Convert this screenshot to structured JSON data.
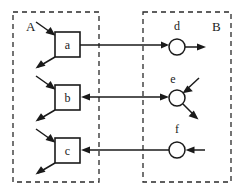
{
  "diagram": {
    "background_color": "#ffffff",
    "stroke_color": "#1a1a1a",
    "dash_color": "#2a2a2a",
    "regions": [
      {
        "id": "A",
        "label": "A",
        "label_x": 26,
        "label_y": 31,
        "x": 13,
        "y": 12,
        "width": 86,
        "height": 170
      },
      {
        "id": "B",
        "label": "B",
        "label_x": 212,
        "label_y": 31,
        "x": 143,
        "y": 12,
        "width": 88,
        "height": 170
      }
    ],
    "boxes": [
      {
        "id": "a",
        "label": "a",
        "x": 55,
        "y": 32,
        "width": 25,
        "height": 25,
        "cx": 67.5,
        "cy": 44.5,
        "label_y": 49
      },
      {
        "id": "b",
        "label": "b",
        "x": 55,
        "y": 85,
        "width": 25,
        "height": 25,
        "cx": 67.5,
        "cy": 97.5,
        "label_y": 102
      },
      {
        "id": "c",
        "label": "c",
        "x": 55,
        "y": 138,
        "width": 25,
        "height": 25,
        "cx": 67.5,
        "cy": 150.5,
        "label_y": 155
      }
    ],
    "circles": [
      {
        "id": "d",
        "label": "d",
        "cx": 177,
        "cy": 47,
        "r": 8,
        "label_x": 177,
        "label_y": 30
      },
      {
        "id": "e",
        "label": "e",
        "cx": 177,
        "cy": 98,
        "r": 8,
        "label_x": 173,
        "label_y": 83
      },
      {
        "id": "f",
        "label": "f",
        "cx": 177,
        "cy": 150,
        "r": 8,
        "label_x": 177,
        "label_y": 133
      }
    ],
    "connections": [
      {
        "id": "a-to-d",
        "from": "a",
        "to": "d",
        "direction": "forward",
        "row": 1
      },
      {
        "id": "b-to-e",
        "from": "b",
        "to": "e",
        "direction": "bidirectional",
        "row": 2
      },
      {
        "id": "f-to-c",
        "from": "f",
        "to": "c",
        "direction": "backward",
        "row": 3
      }
    ],
    "external_arrows": [
      {
        "id": "into-a",
        "target": "a",
        "kind": "inbound",
        "side": "upper-left"
      },
      {
        "id": "out-of-a",
        "target": "a",
        "kind": "outbound",
        "side": "lower-left"
      },
      {
        "id": "into-b",
        "target": "b",
        "kind": "inbound",
        "side": "upper-left"
      },
      {
        "id": "out-of-b",
        "target": "b",
        "kind": "outbound",
        "side": "lower-left"
      },
      {
        "id": "into-c",
        "target": "c",
        "kind": "inbound",
        "side": "upper-left"
      },
      {
        "id": "out-of-c",
        "target": "c",
        "kind": "outbound",
        "side": "lower-left"
      },
      {
        "id": "out-of-d",
        "target": "d",
        "kind": "outbound",
        "side": "right"
      },
      {
        "id": "into-e",
        "target": "e",
        "kind": "inbound",
        "side": "upper-right"
      },
      {
        "id": "out-of-e",
        "target": "e",
        "kind": "outbound",
        "side": "lower-right"
      },
      {
        "id": "into-f",
        "target": "f",
        "kind": "inbound",
        "side": "right"
      }
    ]
  }
}
